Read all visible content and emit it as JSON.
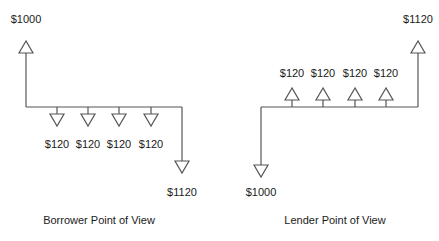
{
  "colors": {
    "line": "#555555",
    "text": "#1a1a1a",
    "background": "#ffffff"
  },
  "borrower": {
    "caption": "Borrower Point of View",
    "inflow": {
      "label": "$1000",
      "direction": "up"
    },
    "payments": [
      {
        "label": "$120",
        "direction": "down"
      },
      {
        "label": "$120",
        "direction": "down"
      },
      {
        "label": "$120",
        "direction": "down"
      },
      {
        "label": "$120",
        "direction": "down"
      }
    ],
    "final": {
      "label": "$1120",
      "direction": "down"
    }
  },
  "lender": {
    "caption": "Lender Point of View",
    "outflow": {
      "label": "$1000",
      "direction": "down"
    },
    "receipts": [
      {
        "label": "$120",
        "direction": "up"
      },
      {
        "label": "$120",
        "direction": "up"
      },
      {
        "label": "$120",
        "direction": "up"
      },
      {
        "label": "$120",
        "direction": "up"
      }
    ],
    "final": {
      "label": "$1120",
      "direction": "up"
    }
  }
}
